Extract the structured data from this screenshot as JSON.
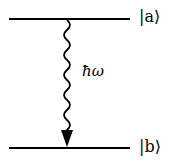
{
  "diagram": {
    "type": "energy-level-transition",
    "levels": [
      {
        "id": "upper",
        "label": "|a⟩"
      },
      {
        "id": "lower",
        "label": "|b⟩"
      }
    ],
    "transition": {
      "from": "upper",
      "to": "lower",
      "style": "wavy-arrow",
      "label": "ħω"
    }
  }
}
